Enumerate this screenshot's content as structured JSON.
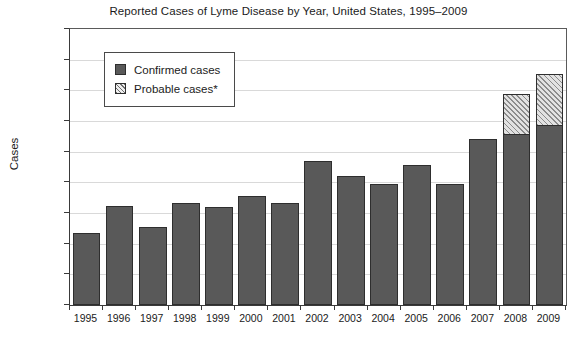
{
  "chart_data": {
    "type": "bar",
    "title": "Reported Cases of Lyme Disease by Year, United States, 1995–2009",
    "xlabel": "",
    "ylabel": "Cases",
    "stacked": true,
    "grid": true,
    "legend_position": "inside-top-left",
    "ylim": [
      0,
      45000
    ],
    "ytick_step": 5000,
    "ytick_labels": [
      "45,000",
      "40,000",
      "35,000",
      "30,000",
      "25,000",
      "20,000",
      "15,000",
      "10,000",
      "5,000",
      "0"
    ],
    "ytick_values": [
      45000,
      40000,
      35000,
      30000,
      25000,
      20000,
      15000,
      10000,
      5000,
      0
    ],
    "categories": [
      "1995",
      "1996",
      "1997",
      "1998",
      "1999",
      "2000",
      "2001",
      "2002",
      "2003",
      "2004",
      "2005",
      "2006",
      "2007",
      "2008",
      "2009"
    ],
    "series": [
      {
        "name": "Confirmed cases",
        "color": "#595959",
        "pattern": "solid",
        "values": [
          11700,
          16200,
          12700,
          16600,
          16000,
          17700,
          16700,
          23500,
          21000,
          19700,
          22900,
          19700,
          27000,
          27900,
          29400
        ]
      },
      {
        "name": "Probable cases*",
        "color": "#c9c9c9",
        "pattern": "diagonal-hatch",
        "values": [
          0,
          0,
          0,
          0,
          0,
          0,
          0,
          0,
          0,
          0,
          0,
          0,
          0,
          6700,
          8500
        ]
      }
    ],
    "totals": [
      11700,
      16200,
      12700,
      16600,
      16000,
      17700,
      16700,
      23500,
      21000,
      19700,
      22900,
      19700,
      27000,
      34600,
      37900
    ]
  },
  "legend": {
    "items": [
      {
        "label": "Confirmed cases",
        "swatch": "solid"
      },
      {
        "label": "Probable cases*",
        "swatch": "diagonal-hatch"
      }
    ]
  },
  "colors": {
    "confirmed": "#595959",
    "probable": "#c9c9c9",
    "axis": "#3a3a3a",
    "grid": "#d9d9d9",
    "background": "#ffffff"
  }
}
